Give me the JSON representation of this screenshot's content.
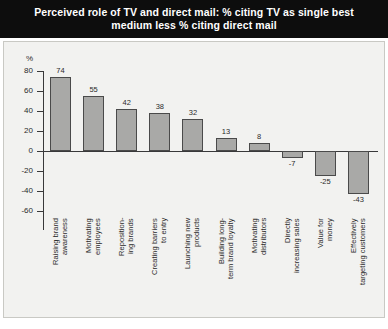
{
  "title": "Perceived role of TV and direct mail: % citing TV as single best medium less % citing direct mail",
  "colors": {
    "header_bg": "#0d0d0d",
    "header_text": "#ffffff",
    "panel_bg": "#f2f2f0",
    "panel_border": "#c9c9c4",
    "bar_fill": "#a9a9a7",
    "bar_stroke": "#4a4a4a",
    "axis": "#39393a",
    "text": "#2b2b2b"
  },
  "axis": {
    "unit_label": "%",
    "ticks": [
      "80",
      "60",
      "40",
      "20",
      "0",
      "-20",
      "-40",
      "-60"
    ],
    "tick_values": [
      80,
      60,
      40,
      20,
      0,
      -20,
      -40,
      -60
    ]
  },
  "chart_data": {
    "type": "bar",
    "title": "Perceived role of TV and direct mail: % citing TV as single best medium less % citing direct mail",
    "xlabel": "",
    "ylabel": "%",
    "ylim": [
      -60,
      80
    ],
    "grid": false,
    "legend": "none",
    "categories": [
      "Raising brand\nawareness",
      "Motivating\nemployees",
      "Reposition-\ning brands",
      "Creating barriers\nto entry",
      "Launching new\nproducts",
      "Building long-\nterm brand loyalty",
      "Motivating\ndistributors",
      "Directly\nincreasing sales",
      "Value for\nmoney",
      "Effectively\ntargeting customers"
    ],
    "values": [
      74,
      55,
      42,
      38,
      32,
      13,
      8,
      -7,
      -25,
      -43
    ],
    "labels": [
      "74",
      "55",
      "42",
      "38",
      "32",
      "13",
      "8",
      "-7",
      "-25",
      "-43"
    ]
  }
}
